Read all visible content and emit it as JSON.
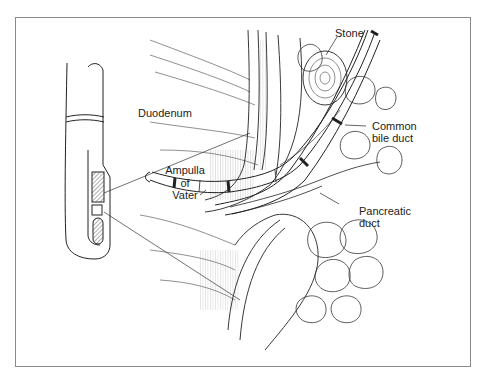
{
  "figure": {
    "type": "anatomical-illustration",
    "labels": {
      "stone": "Stone",
      "duodenum": "Duodenum",
      "common_bile_duct_line1": "Common",
      "common_bile_duct_line2": "bile duct",
      "ampulla_line1": "Ampulla",
      "ampulla_line2": "of",
      "ampulla_line3": "Vater",
      "pancreatic_duct_line1": "Pancreatic",
      "pancreatic_duct_line2": "duct"
    },
    "colors": {
      "line": "#222222",
      "frame": "#8a8a8a",
      "background": "#ffffff"
    }
  }
}
